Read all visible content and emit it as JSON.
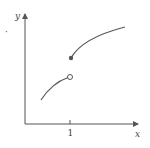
{
  "diagram": {
    "type": "piecewise-function-graph",
    "axes": {
      "x_label": "x",
      "y_label": "y",
      "x_tick_labels": [
        "1"
      ]
    },
    "discontinuity": {
      "at_x": "1",
      "left_endpoint": "open-circle",
      "right_endpoint": "filled-dot",
      "kind": "jump"
    },
    "stray_mark": "·",
    "colors": {
      "axis": "#555555",
      "curve": "#555555",
      "background": "#ffffff"
    }
  }
}
